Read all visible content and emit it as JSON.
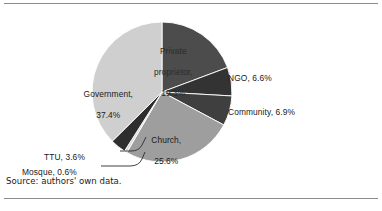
{
  "figure": {
    "source_note": "Source: authors' own data.",
    "background": "#ffffff",
    "rule_color": "#8c8c8c"
  },
  "chart_data": {
    "type": "pie",
    "title": "",
    "subtitle": "",
    "xlabel": "",
    "ylabel": "",
    "legend_position": "none",
    "grid": false,
    "label_format": "{name}, {value}%",
    "start_angle_deg": 0,
    "direction": "clockwise",
    "total": 100.0,
    "categories": [
      "Private proprietor",
      "NGO",
      "Community",
      "Church",
      "Mosque",
      "TTU",
      "Government"
    ],
    "values": [
      19.3,
      6.6,
      6.9,
      25.6,
      0.6,
      3.6,
      37.4
    ],
    "colors": [
      "#4c4c4c",
      "#333333",
      "#3f3f3f",
      "#9e9e9e",
      "#d8d8d8",
      "#2e2e2e",
      "#cfcfcf"
    ],
    "slices": [
      {
        "name": "Private proprietor",
        "value": 19.3,
        "label": "Private\nproprietor,\n19.3%",
        "label_line1": "Private",
        "label_line2": "proprietor,",
        "label_line3": "19.3%",
        "color": "#4c4c4c",
        "label_placement": "inside",
        "label_color": "#2b2b2b"
      },
      {
        "name": "NGO",
        "value": 6.6,
        "label": "NGO, 6.6%",
        "color": "#333333",
        "label_placement": "outside",
        "label_color": "#1a1a1a"
      },
      {
        "name": "Community",
        "value": 6.9,
        "label": "Community, 6.9%",
        "color": "#3f3f3f",
        "label_placement": "outside",
        "label_color": "#1a1a1a"
      },
      {
        "name": "Church",
        "value": 25.6,
        "label": "Church,\n25.6%",
        "label_line1": "Church,",
        "label_line2": "25.6%",
        "color": "#9e9e9e",
        "label_placement": "inside",
        "label_color": "#1a1a1a"
      },
      {
        "name": "Mosque",
        "value": 0.6,
        "label": "Mosque, 0.6%",
        "color": "#d8d8d8",
        "label_placement": "outside-leader",
        "label_color": "#1a1a1a"
      },
      {
        "name": "TTU",
        "value": 3.6,
        "label": "TTU, 3.6%",
        "color": "#2e2e2e",
        "label_placement": "outside-leader",
        "label_color": "#1a1a1a"
      },
      {
        "name": "Government",
        "value": 37.4,
        "label": "Government,\n37.4%",
        "label_line1": "Government,",
        "label_line2": "37.4%",
        "color": "#cfcfcf",
        "label_placement": "inside",
        "label_color": "#1a1a1a"
      }
    ]
  }
}
